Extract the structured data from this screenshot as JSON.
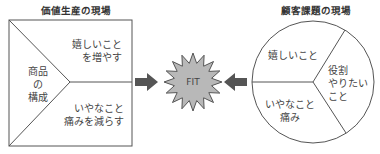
{
  "left_panel": {
    "title": "価値生産の現場",
    "product": [
      "商品",
      "の",
      "構成"
    ],
    "gain": [
      "嬉しいこと",
      "を増やす"
    ],
    "pain": [
      "いやなこと",
      "痛みを減らす"
    ]
  },
  "center": {
    "label": "FIT",
    "fill": "#b8b8b8",
    "arrow_color": "#555555"
  },
  "right_panel": {
    "title": "顧客課題の現場",
    "gain": [
      "嬉しいこと"
    ],
    "pain": [
      "いやなこと",
      "痛み"
    ],
    "job": [
      "役割",
      "やりたい",
      "こと"
    ]
  }
}
